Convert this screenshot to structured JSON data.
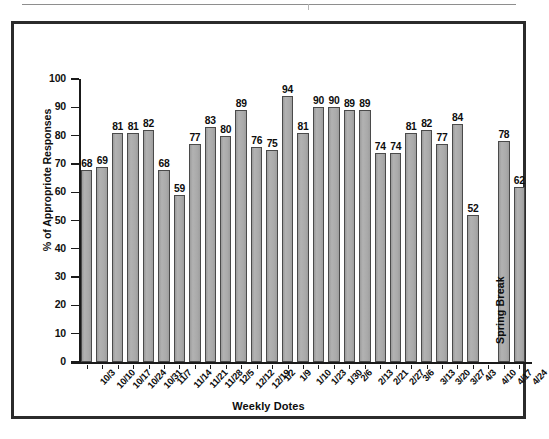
{
  "chart_data": {
    "type": "bar",
    "title": "",
    "subtitle": "",
    "xlabel": "Weekly Dotes",
    "ylabel": "% of Appropriote Responses",
    "ylim": [
      0,
      100
    ],
    "ytick_step": 10,
    "yticks": [
      "100",
      "90",
      "80",
      "70",
      "60",
      "50",
      "40",
      "30",
      "20",
      "10",
      "0"
    ],
    "grid": false,
    "legend": null,
    "bar_color": "#a9a9a9",
    "bar_edge_color": "#4a4a4a",
    "categories": [
      "10/3",
      "10/10",
      "10/17",
      "10/24",
      "10/31",
      "11/7",
      "11/14",
      "11/21",
      "11/28",
      "12/5",
      "12/12",
      "12/19",
      "1/2",
      "1/9",
      "1/10",
      "1/23",
      "1/30",
      "2/6",
      "2/13",
      "2/21",
      "2/27",
      "3/6",
      "3/13",
      "3/20",
      "3/27",
      "4/3",
      "4/10",
      "4/17",
      "4/24"
    ],
    "values": [
      68,
      69,
      81,
      81,
      82,
      68,
      59,
      77,
      83,
      80,
      89,
      76,
      75,
      94,
      81,
      90,
      90,
      89,
      89,
      74,
      74,
      81,
      82,
      77,
      84,
      52,
      null,
      78,
      62
    ],
    "value_labels": [
      "68",
      "69",
      "81",
      "81",
      "82",
      "68",
      "59",
      "77",
      "83",
      "80",
      "89",
      "76",
      "75",
      "94",
      "81",
      "90",
      "90",
      "89",
      "89",
      "74",
      "74",
      "81",
      "82",
      "77",
      "84",
      "52",
      "",
      "78",
      "62"
    ],
    "annotations": [
      {
        "text": "Spring Break",
        "category": "4/10",
        "orientation": "vertical",
        "note": "no bar plotted for this week"
      }
    ]
  },
  "figure": {
    "frame_color": "#2b2b2b",
    "background": "#ffffff",
    "axis_color": "#1a1a1a"
  }
}
